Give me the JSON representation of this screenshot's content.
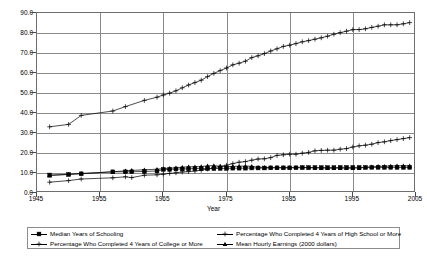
{
  "chart_data": {
    "type": "line",
    "title": "",
    "xlabel": "Year",
    "ylabel": "",
    "xlim": [
      1945,
      2005
    ],
    "ylim": [
      0.0,
      90.0
    ],
    "xticks": [
      "1945",
      "1955",
      "1965",
      "1975",
      "1985",
      "1995",
      "2005"
    ],
    "yticks": [
      "0.0",
      "10.0",
      "20.0",
      "30.0",
      "40.0",
      "50.0",
      "60.0",
      "70.0",
      "80.0",
      "90.0"
    ],
    "grid": true,
    "legend_position": "bottom",
    "series": [
      {
        "name": "Median Years of Schooling",
        "marker": "square",
        "x": [
          1947,
          1950,
          1952,
          1957,
          1959,
          1960,
          1962,
          1964,
          1965,
          1966,
          1967,
          1968,
          1969,
          1970,
          1971,
          1972,
          1973,
          1974,
          1975,
          1976,
          1977,
          1978,
          1979,
          1980,
          1981,
          1982,
          1983,
          1984,
          1985,
          1986,
          1987,
          1988,
          1989,
          1990,
          1991,
          1992,
          1993,
          1994,
          1995,
          1996,
          1997,
          1998,
          1999,
          2000,
          2001,
          2002,
          2003,
          2004
        ],
        "values": [
          9.0,
          9.3,
          9.6,
          10.6,
          10.6,
          10.6,
          10.8,
          11.0,
          11.8,
          11.8,
          12.0,
          12.0,
          12.1,
          12.2,
          12.2,
          12.2,
          12.2,
          12.3,
          12.3,
          12.4,
          12.4,
          12.4,
          12.5,
          12.5,
          12.5,
          12.6,
          12.6,
          12.6,
          12.6,
          12.6,
          12.7,
          12.7,
          12.7,
          12.7,
          12.7,
          12.7,
          12.8,
          12.8,
          12.8,
          12.8,
          12.8,
          12.8,
          12.8,
          12.8,
          12.8,
          12.8,
          12.8,
          12.8
        ]
      },
      {
        "name": "Percentage Who Completed 4 Years of High School or More",
        "marker": "plus",
        "x": [
          1947,
          1950,
          1952,
          1957,
          1959,
          1962,
          1964,
          1965,
          1966,
          1967,
          1968,
          1969,
          1970,
          1971,
          1972,
          1973,
          1974,
          1975,
          1976,
          1977,
          1978,
          1979,
          1980,
          1981,
          1982,
          1983,
          1984,
          1985,
          1986,
          1987,
          1988,
          1989,
          1990,
          1991,
          1992,
          1993,
          1994,
          1995,
          1996,
          1997,
          1998,
          1999,
          2000,
          2001,
          2002,
          2003,
          2004
        ],
        "values": [
          33.1,
          34.3,
          38.8,
          41.0,
          43.2,
          46.3,
          47.9,
          49.0,
          49.9,
          51.1,
          52.6,
          54.0,
          55.2,
          56.4,
          58.2,
          59.8,
          61.2,
          62.5,
          64.1,
          64.9,
          65.9,
          67.7,
          68.6,
          69.7,
          71.0,
          72.1,
          73.3,
          73.9,
          74.7,
          75.6,
          76.2,
          76.9,
          77.6,
          78.4,
          79.4,
          80.2,
          80.9,
          81.7,
          81.7,
          82.1,
          82.8,
          83.4,
          84.1,
          84.1,
          84.1,
          84.6,
          85.2
        ]
      },
      {
        "name": "Percentage Who Completed 4 Years of College or More",
        "marker": "plus",
        "x": [
          1947,
          1950,
          1952,
          1957,
          1959,
          1960,
          1962,
          1964,
          1965,
          1966,
          1967,
          1968,
          1969,
          1970,
          1971,
          1972,
          1973,
          1974,
          1975,
          1976,
          1977,
          1978,
          1979,
          1980,
          1981,
          1982,
          1983,
          1984,
          1985,
          1986,
          1987,
          1988,
          1989,
          1990,
          1991,
          1992,
          1993,
          1994,
          1995,
          1996,
          1997,
          1998,
          1999,
          2000,
          2001,
          2002,
          2003,
          2004
        ],
        "values": [
          5.4,
          6.2,
          7.0,
          7.6,
          8.1,
          7.7,
          8.9,
          9.1,
          9.4,
          9.8,
          10.1,
          10.5,
          10.7,
          11.0,
          11.4,
          12.0,
          12.6,
          13.3,
          13.9,
          14.7,
          15.4,
          15.7,
          16.4,
          17.0,
          17.1,
          17.7,
          18.8,
          19.1,
          19.4,
          19.4,
          19.9,
          20.3,
          21.1,
          21.3,
          21.4,
          21.4,
          21.9,
          22.2,
          23.0,
          23.6,
          23.9,
          24.4,
          25.2,
          25.6,
          26.2,
          26.7,
          27.2,
          27.7
        ]
      },
      {
        "name": "Mean Hourly Earnings (2000 dollars)",
        "marker": "triangle",
        "x": [
          1947,
          1950,
          1952,
          1957,
          1959,
          1960,
          1962,
          1964,
          1965,
          1966,
          1967,
          1968,
          1969,
          1970,
          1971,
          1972,
          1973,
          1974,
          1975,
          1976,
          1977,
          1978,
          1979,
          1980,
          1981,
          1982,
          1983,
          1984,
          1985,
          1986,
          1987,
          1988,
          1989,
          1990,
          1991,
          1992,
          1993,
          1994,
          1995,
          1996,
          1997,
          1998,
          1999,
          2000,
          2001,
          2002,
          2003,
          2004
        ],
        "values": [
          8.7,
          9.3,
          9.8,
          10.6,
          11.1,
          11.3,
          11.6,
          11.9,
          12.2,
          12.4,
          12.6,
          12.9,
          13.1,
          13.1,
          13.2,
          13.6,
          13.7,
          13.4,
          13.2,
          13.3,
          13.4,
          13.5,
          13.3,
          12.9,
          12.8,
          12.7,
          12.7,
          12.7,
          12.7,
          12.9,
          12.8,
          12.7,
          12.6,
          12.5,
          12.4,
          12.4,
          12.4,
          12.4,
          12.4,
          12.5,
          12.8,
          13.1,
          13.3,
          13.4,
          13.5,
          13.6,
          13.6,
          13.6
        ]
      }
    ],
    "legend": [
      {
        "label": "Median Years of Schooling",
        "marker": "square"
      },
      {
        "label": "Percentage Who Completed 4 Years of High School or More",
        "marker": "plus"
      },
      {
        "label": "Percentage Who Completed 4 Years of College or More",
        "marker": "plus"
      },
      {
        "label": "Mean Hourly Earnings (2000 dollars)",
        "marker": "triangle"
      }
    ],
    "colors": {
      "series_stroke": "#000000",
      "gridline": "#8a8a8a",
      "frame": "#6e6e6e",
      "background": "#ffffff",
      "text": "#000000"
    }
  }
}
